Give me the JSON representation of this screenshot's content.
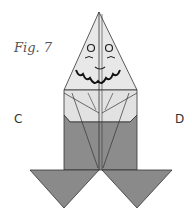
{
  "figure": {
    "caption": "Fig. 7",
    "points": {
      "left": "C",
      "right": "D"
    },
    "colors": {
      "paper_light": "#e6e6e6",
      "paper_dark": "#8a8a8a",
      "line": "#333333"
    }
  }
}
